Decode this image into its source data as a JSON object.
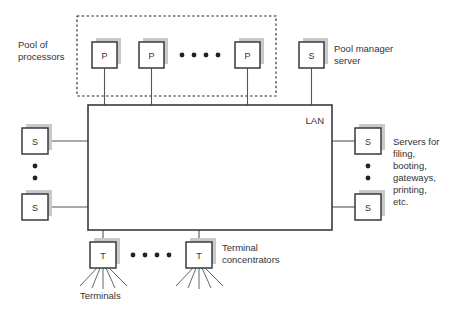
{
  "diagram": {
    "colors": {
      "box_stroke": "#3a3a3a",
      "box_fill": "#ffffff",
      "shadow": "#c9c9c9",
      "line": "#555555",
      "text": "#333333",
      "dashed_stroke": "#222222",
      "background": "#ffffff"
    },
    "lan": {
      "label": "LAN",
      "x": 88,
      "y": 105,
      "width": 244,
      "height": 125
    },
    "dashed_region": {
      "x": 77,
      "y": 16,
      "width": 199,
      "height": 80
    },
    "labels": {
      "pool_of_processors": "Pool of\nprocessors",
      "pool_of_processors_line1": "Pool of",
      "pool_of_processors_line2": "processors",
      "pool_manager_line1": "Pool manager",
      "pool_manager_line2": "server",
      "servers_line1": "Servers for",
      "servers_line2": "filing,",
      "servers_line3": "booting,",
      "servers_line4": "gateways,",
      "servers_line5": "printing,",
      "servers_line6": "etc.",
      "terminal_concentrators_line1": "Terminal",
      "terminal_concentrators_line2": "concentrators",
      "terminals": "Terminals"
    },
    "nodes": [
      {
        "id": "p1",
        "label": "P",
        "x": 92,
        "y": 42,
        "w": 25,
        "h": 26,
        "name": "processor-node-1"
      },
      {
        "id": "p2",
        "label": "P",
        "x": 139,
        "y": 42,
        "w": 25,
        "h": 26,
        "name": "processor-node-2"
      },
      {
        "id": "p3",
        "label": "P",
        "x": 235,
        "y": 42,
        "w": 25,
        "h": 26,
        "name": "processor-node-3"
      },
      {
        "id": "pm",
        "label": "S",
        "x": 299,
        "y": 42,
        "w": 25,
        "h": 26,
        "name": "pool-manager-server-node"
      },
      {
        "id": "sl1",
        "label": "S",
        "x": 22,
        "y": 128,
        "w": 26,
        "h": 26,
        "name": "left-server-node-1"
      },
      {
        "id": "sl2",
        "label": "S",
        "x": 22,
        "y": 194,
        "w": 26,
        "h": 26,
        "name": "left-server-node-2"
      },
      {
        "id": "sr1",
        "label": "S",
        "x": 355,
        "y": 128,
        "w": 26,
        "h": 26,
        "name": "right-server-node-1"
      },
      {
        "id": "sr2",
        "label": "S",
        "x": 355,
        "y": 194,
        "w": 26,
        "h": 26,
        "name": "right-server-node-2"
      },
      {
        "id": "t1",
        "label": "T",
        "x": 90,
        "y": 242,
        "w": 26,
        "h": 26,
        "name": "terminal-concentrator-node-1"
      },
      {
        "id": "t2",
        "label": "T",
        "x": 186,
        "y": 242,
        "w": 26,
        "h": 26,
        "name": "terminal-concentrator-node-2"
      }
    ],
    "ellipsis": {
      "processors_horizontal_count": 4,
      "terminals_horizontal_count": 4,
      "left_servers_vertical_count": 2,
      "right_servers_vertical_count": 2
    },
    "terminals_per_concentrator": 5
  }
}
